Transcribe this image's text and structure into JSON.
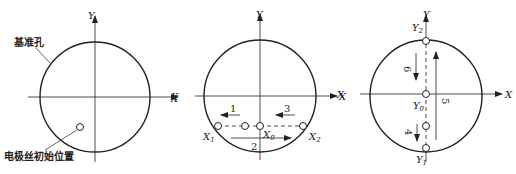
{
  "panels": [
    {
      "id": "initial-position",
      "axis_x": "X",
      "axis_y": "Y",
      "labels": {
        "reference_hole": "基准孔",
        "wire_initial_position": "电极丝初始位置"
      }
    },
    {
      "id": "x-centering",
      "axis_x": "X",
      "axis_y": "Y",
      "axis_x_left": "X",
      "points": {
        "x1": "X",
        "x1_sub": "1",
        "x0": "X",
        "x0_sub": "0",
        "x2": "X",
        "x2_sub": "2"
      },
      "steps": [
        "1",
        "2",
        "3"
      ]
    },
    {
      "id": "y-centering",
      "axis_x": "X",
      "axis_y": "Y",
      "axis_x_left": "X",
      "points": {
        "y2": "Y",
        "y2_sub": "2",
        "y0": "Y",
        "y0_sub": "0",
        "y1": "Y",
        "y1_sub": "1"
      },
      "steps": [
        "4",
        "5",
        "6"
      ]
    }
  ],
  "colors": {
    "stroke": "#222222",
    "background": "#ffffff"
  }
}
